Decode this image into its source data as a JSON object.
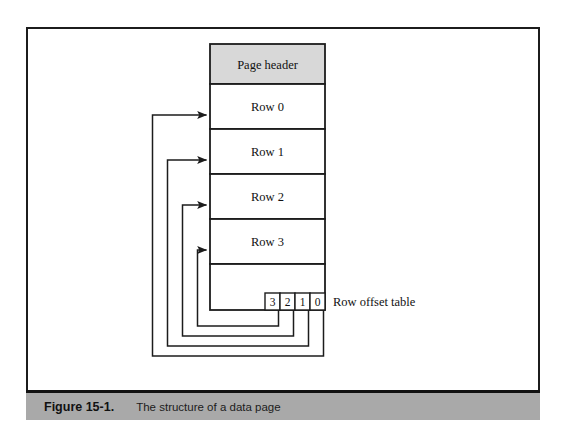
{
  "figure": {
    "caption_number": "Figure 15-1.",
    "caption_text": "The structure of a data page",
    "caption_bar_color": "#a9a9a9",
    "frame_border_color": "#1c1c1c"
  },
  "diagram": {
    "type": "block-diagram",
    "title": "The structure of a data page",
    "page": {
      "header_label": "Page header",
      "header_fill": "#d8d8d8",
      "rows": [
        {
          "label": "Row 0"
        },
        {
          "label": "Row 1"
        },
        {
          "label": "Row 2"
        },
        {
          "label": "Row 3"
        }
      ],
      "free_space_label": "",
      "border_color": "#1c1c1c",
      "fill": "#ffffff"
    },
    "row_offset_table": {
      "label": "Row offset table",
      "cells": [
        {
          "value": "3",
          "points_to": "Row 3"
        },
        {
          "value": "2",
          "points_to": "Row 2"
        },
        {
          "value": "1",
          "points_to": "Row 1"
        },
        {
          "value": "0",
          "points_to": "Row 0"
        }
      ]
    },
    "connectors": [
      {
        "from": "offset-cell-0",
        "to": "Row 0",
        "style": "elbow-arrow"
      },
      {
        "from": "offset-cell-1",
        "to": "Row 1",
        "style": "elbow-arrow"
      },
      {
        "from": "offset-cell-2",
        "to": "Row 2",
        "style": "elbow-arrow"
      },
      {
        "from": "offset-cell-3",
        "to": "Row 3",
        "style": "elbow-arrow"
      }
    ]
  }
}
